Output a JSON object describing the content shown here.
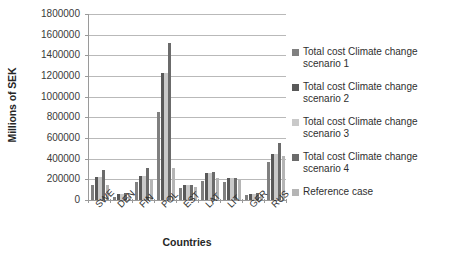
{
  "chart_data": {
    "type": "bar",
    "title": "",
    "xlabel": "Countries",
    "ylabel": "Millions of SEK",
    "ylim": [
      0,
      1800000
    ],
    "ytick_labels": [
      "1800000",
      "1600000",
      "1400000",
      "1200000",
      "1000000",
      "800000",
      "600000",
      "400000",
      "200000",
      "0"
    ],
    "ytick_values": [
      1800000,
      1600000,
      1400000,
      1200000,
      1000000,
      800000,
      600000,
      400000,
      200000,
      0
    ],
    "grid": true,
    "legend_position": "right",
    "categories": [
      "SWE",
      "DEN",
      "FIN",
      "POL",
      "EST",
      "LAT",
      "LIT",
      "GER",
      "RUS"
    ],
    "series": [
      {
        "name": "Total cost Climate change scenario 1",
        "color": "#808080",
        "values": [
          150000,
          30000,
          170000,
          850000,
          120000,
          180000,
          175000,
          45000,
          370000
        ]
      },
      {
        "name": "Total cost Climate change scenario 2",
        "color": "#595959",
        "values": [
          225000,
          55000,
          230000,
          1230000,
          145000,
          260000,
          215000,
          60000,
          450000
        ]
      },
      {
        "name": "Total cost Climate change scenario 3",
        "color": "#c9c9c9",
        "values": [
          225000,
          55000,
          230000,
          1230000,
          145000,
          265000,
          215000,
          60000,
          450000
        ]
      },
      {
        "name": "Total cost Climate change scenario 4",
        "color": "#6b6b6b",
        "values": [
          290000,
          70000,
          310000,
          1520000,
          150000,
          275000,
          215000,
          70000,
          550000
        ]
      },
      {
        "name": "Reference case",
        "color": "#b5b5b5",
        "values": [
          150000,
          40000,
          205000,
          310000,
          130000,
          215000,
          190000,
          55000,
          430000
        ]
      }
    ]
  },
  "axes": {
    "y_title": "Millions of SEK",
    "x_title": "Countries"
  },
  "legend": {
    "items": [
      {
        "label": "Total cost Climate change scenario 1",
        "color": "#808080"
      },
      {
        "label": "Total cost Climate change scenario 2",
        "color": "#595959"
      },
      {
        "label": "Total cost Climate change scenario 3",
        "color": "#c9c9c9"
      },
      {
        "label": "Total cost Climate change scenario 4",
        "color": "#6b6b6b"
      },
      {
        "label": "Reference case",
        "color": "#b5b5b5"
      }
    ]
  }
}
